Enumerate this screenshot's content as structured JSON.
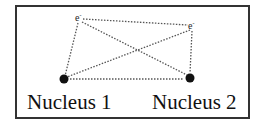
{
  "diagram": {
    "nuclei": [
      {
        "label": "Nucleus 1",
        "x": 64,
        "y": 79
      },
      {
        "label": "Nucleus 2",
        "x": 190,
        "y": 78
      }
    ],
    "electrons": [
      {
        "label": "e",
        "charge": "-",
        "x": 79,
        "y": 18
      },
      {
        "label": "e",
        "charge": "-",
        "x": 192,
        "y": 26
      }
    ],
    "interactions": [
      {
        "from": "e1",
        "to": "e2",
        "style": "dotted"
      },
      {
        "from": "e1",
        "to": "nucleus1",
        "style": "dotted"
      },
      {
        "from": "e1",
        "to": "nucleus2",
        "style": "dotted"
      },
      {
        "from": "e2",
        "to": "nucleus1",
        "style": "dotted"
      },
      {
        "from": "e2",
        "to": "nucleus2",
        "style": "dotted"
      },
      {
        "from": "nucleus1",
        "to": "nucleus2",
        "style": "dotted"
      }
    ],
    "colors": {
      "line": "#555555",
      "nucleus": "#111111",
      "border": "#333333"
    }
  }
}
